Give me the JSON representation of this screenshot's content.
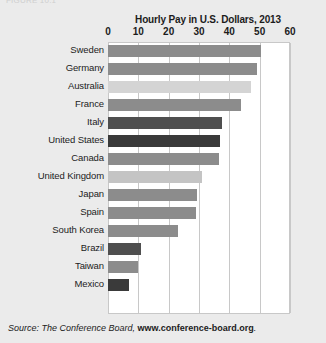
{
  "page": {
    "background_color": "#ebebeb",
    "cropped_top_text": "FIGURE 10.1"
  },
  "source_note": {
    "prefix": "Source: The Conference Board, ",
    "link_text": "www.conference-board.org",
    "suffix": "."
  },
  "chart_data": {
    "type": "bar",
    "orientation": "horizontal",
    "title": "Hourly Pay in U.S. Dollars, 2013",
    "xlabel": "",
    "ylabel": "",
    "xlim": [
      0,
      60
    ],
    "xticks": [
      0,
      10,
      20,
      30,
      40,
      50,
      60
    ],
    "grid": true,
    "legend": "none",
    "categories": [
      "Sweden",
      "Germany",
      "Australia",
      "France",
      "Italy",
      "United States",
      "Canada",
      "United Kingdom",
      "Japan",
      "Spain",
      "South Korea",
      "Brazil",
      "Taiwan",
      "Mexico"
    ],
    "values": [
      50.5,
      49,
      47,
      44,
      37.5,
      37,
      36.5,
      31,
      29.5,
      29,
      23,
      11,
      10,
      7
    ],
    "bar_colors": [
      "#8c8c8c",
      "#8c8c8c",
      "#d4d4d4",
      "#8c8c8c",
      "#4f4f4f",
      "#3a3a3a",
      "#8c8c8c",
      "#c4c4c4",
      "#8c8c8c",
      "#8c8c8c",
      "#8c8c8c",
      "#4f4f4f",
      "#8c8c8c",
      "#3a3a3a"
    ],
    "bars": [
      {
        "label": "Sweden",
        "value": 50.5,
        "color": "#8c8c8c"
      },
      {
        "label": "Germany",
        "value": 49,
        "color": "#8c8c8c"
      },
      {
        "label": "Australia",
        "value": 47,
        "color": "#d4d4d4"
      },
      {
        "label": "France",
        "value": 44,
        "color": "#8c8c8c"
      },
      {
        "label": "Italy",
        "value": 37.5,
        "color": "#4f4f4f"
      },
      {
        "label": "United States",
        "value": 37,
        "color": "#3a3a3a"
      },
      {
        "label": "Canada",
        "value": 36.5,
        "color": "#8c8c8c"
      },
      {
        "label": "United Kingdom",
        "value": 31,
        "color": "#c4c4c4"
      },
      {
        "label": "Japan",
        "value": 29.5,
        "color": "#8c8c8c"
      },
      {
        "label": "Spain",
        "value": 29,
        "color": "#8c8c8c"
      },
      {
        "label": "South Korea",
        "value": 23,
        "color": "#8c8c8c"
      },
      {
        "label": "Brazil",
        "value": 11,
        "color": "#4f4f4f"
      },
      {
        "label": "Taiwan",
        "value": 10,
        "color": "#8c8c8c"
      },
      {
        "label": "Mexico",
        "value": 7,
        "color": "#3a3a3a"
      }
    ]
  }
}
